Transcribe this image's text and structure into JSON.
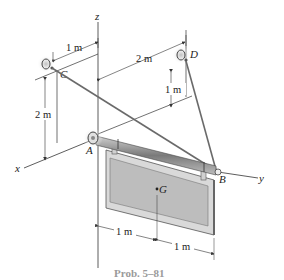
{
  "caption": "Prob. 5–81",
  "axes": {
    "x": "x",
    "y": "y",
    "z": "z"
  },
  "points": {
    "A": "A",
    "B": "B",
    "C": "C",
    "D": "D",
    "G": "G"
  },
  "dimensions": {
    "c_to_z": "1 m",
    "z_to_d": "2 m",
    "c_height": "2 m",
    "d_height": "1 m",
    "a_to_g": "1 m",
    "g_to_edge": "1 m"
  },
  "colors": {
    "line": "#333333",
    "panel_fill": "#bdbdbd",
    "panel_frame": "#d9d9d9",
    "rod": "#8a8a8a",
    "shadow": "#cfcfcf",
    "caption": "#9a9a9a"
  }
}
